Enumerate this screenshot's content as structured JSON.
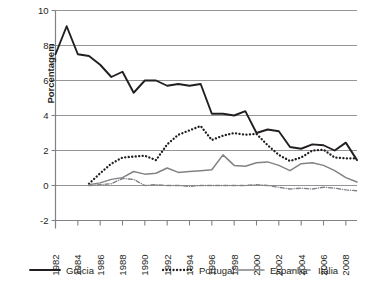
{
  "chart_data": {
    "type": "line",
    "title": "",
    "xlabel": "",
    "ylabel": "Porcentagem",
    "ylim": [
      -2,
      10
    ],
    "yticks": [
      -2,
      0,
      2,
      4,
      6,
      8,
      10
    ],
    "ytick_labels": [
      "-2",
      "0",
      "2",
      "4",
      "6",
      "8",
      "10"
    ],
    "xlim": [
      1982,
      2009
    ],
    "xticks": [
      1982,
      1984,
      1986,
      1988,
      1990,
      1992,
      1994,
      1996,
      1998,
      2000,
      2002,
      2004,
      2006,
      2008
    ],
    "xtick_labels": [
      "1982",
      "1984",
      "1986",
      "1988",
      "1990",
      "1992",
      "1994",
      "1996",
      "1998",
      "2000",
      "2002",
      "2004",
      "2006",
      "2008"
    ],
    "grid": true,
    "legend_position": "bottom",
    "x": [
      1982,
      1983,
      1984,
      1985,
      1986,
      1987,
      1988,
      1989,
      1990,
      1991,
      1992,
      1993,
      1994,
      1995,
      1996,
      1997,
      1998,
      1999,
      2000,
      2001,
      2002,
      2003,
      2004,
      2005,
      2006,
      2007,
      2008,
      2009
    ],
    "series": [
      {
        "name": "Grécia",
        "color": "#231f20",
        "style": "solid",
        "values": [
          7.5,
          9.1,
          7.5,
          7.4,
          6.9,
          6.2,
          6.5,
          5.3,
          6.0,
          6.0,
          5.7,
          5.8,
          5.7,
          5.8,
          4.1,
          4.1,
          4.0,
          4.25,
          3.0,
          3.2,
          3.1,
          2.2,
          2.1,
          2.35,
          2.3,
          2.0,
          2.45,
          1.45
        ]
      },
      {
        "name": "Portugal",
        "color": "#231f20",
        "style": "dotted",
        "values": [
          null,
          null,
          null,
          0.1,
          0.7,
          1.25,
          1.6,
          1.65,
          1.7,
          1.45,
          2.35,
          2.9,
          3.15,
          3.4,
          2.6,
          2.85,
          3.0,
          2.9,
          2.95,
          2.3,
          1.75,
          1.4,
          1.6,
          2.0,
          2.05,
          1.6,
          1.55,
          1.55
        ]
      },
      {
        "name": "Espanha",
        "color": "#808285",
        "style": "solid",
        "values": [
          null,
          null,
          null,
          0.05,
          0.15,
          0.35,
          0.45,
          0.8,
          0.65,
          0.7,
          1.0,
          0.75,
          0.8,
          0.85,
          0.9,
          1.75,
          1.15,
          1.1,
          1.3,
          1.35,
          1.15,
          0.85,
          1.25,
          1.3,
          1.15,
          0.85,
          0.45,
          0.2
        ]
      },
      {
        "name": "Itália",
        "color": "#808285",
        "style": "dashdot",
        "values": [
          null,
          null,
          null,
          0.0,
          0.05,
          0.1,
          0.4,
          0.35,
          0.0,
          0.05,
          0.0,
          0.0,
          -0.05,
          0.0,
          0.0,
          0.0,
          0.0,
          0.0,
          0.05,
          0.0,
          -0.1,
          -0.2,
          -0.15,
          -0.2,
          -0.1,
          -0.15,
          -0.25,
          -0.3
        ]
      }
    ],
    "legend": [
      {
        "label": "Grécia",
        "color": "#231f20",
        "style": "solid"
      },
      {
        "label": "Portugal",
        "color": "#231f20",
        "style": "dotted"
      },
      {
        "label": "Espanha",
        "color": "#808285",
        "style": "solid"
      },
      {
        "label": "Itália",
        "color": "#808285",
        "style": "dashdot"
      }
    ]
  }
}
